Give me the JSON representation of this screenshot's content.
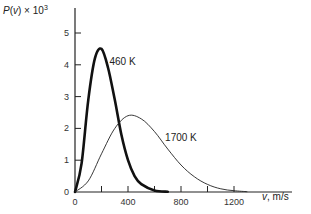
{
  "chart_data": {
    "type": "line",
    "title": "",
    "ylabel": "P(v) × 10³",
    "xlabel": "v, m/s",
    "xlim": [
      0,
      1400
    ],
    "ylim": [
      0,
      5.5
    ],
    "xticks": [
      0,
      200,
      400,
      600,
      800,
      1000,
      1200
    ],
    "xtick_labels": [
      "0",
      "",
      "400",
      "",
      "800",
      "",
      "1200"
    ],
    "yticks": [
      0,
      1,
      2,
      3,
      4,
      5
    ],
    "ytick_labels": [
      "0",
      "1",
      "2",
      "3",
      "4",
      "5"
    ],
    "grid": false,
    "legend": "inline labels",
    "series": [
      {
        "name": "460 K",
        "style": "thick",
        "x": [
          0,
          50,
          100,
          150,
          200,
          250,
          300,
          350,
          400,
          450,
          500,
          600,
          700
        ],
        "y": [
          0,
          0.9,
          2.9,
          4.2,
          4.5,
          3.9,
          2.9,
          1.8,
          1.0,
          0.5,
          0.25,
          0.05,
          0.01
        ]
      },
      {
        "name": "1700 K",
        "style": "thin",
        "x": [
          0,
          100,
          200,
          300,
          400,
          500,
          600,
          700,
          800,
          900,
          1000,
          1100,
          1200,
          1300
        ],
        "y": [
          0,
          0.35,
          1.2,
          2.0,
          2.4,
          2.3,
          1.9,
          1.35,
          0.85,
          0.48,
          0.24,
          0.1,
          0.04,
          0.01
        ]
      }
    ],
    "annotations": [
      {
        "text": "460 K",
        "x": 260,
        "y": 4.0
      },
      {
        "text": "1700 K",
        "x": 680,
        "y": 1.6
      }
    ]
  }
}
